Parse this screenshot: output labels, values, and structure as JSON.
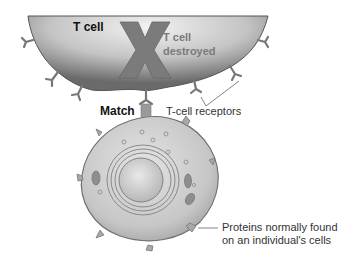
{
  "labels": {
    "t_cell": "T cell",
    "t_cell_destroyed_line1": "T cell",
    "t_cell_destroyed_line2": "destroyed",
    "match": "Match",
    "t_cell_receptors": "T-cell receptors",
    "proteins_line1": "Proteins normally found",
    "proteins_line2": "on an individual's cells"
  },
  "symbols": {
    "destroy_mark": "X"
  },
  "colors": {
    "t_cell_fill_dark": "#6f6f6f",
    "t_cell_fill_light": "#d8d8d8",
    "x_mark": "#7b7b7b",
    "body_cell_fill": "#c9c9c9",
    "nucleus_fill": "#d9d9d9",
    "text_dark": "#111111",
    "text_muted": "#7a7a7a"
  }
}
